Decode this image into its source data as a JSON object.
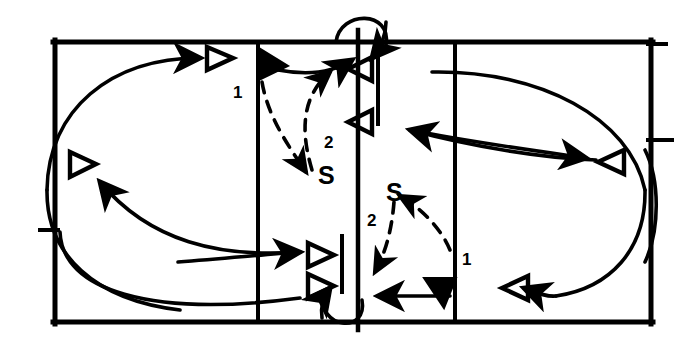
{
  "diagram": {
    "type": "sports-play-diagram",
    "surface_color": "#ffffff",
    "ink_color": "#000000",
    "court": {
      "left_sideline_x": 53,
      "right_sideline_x": 653,
      "top_endline_y": 42,
      "bottom_endline_y": 322,
      "net_x": 358,
      "left_attack_line_x": 258,
      "right_attack_line_x": 455,
      "tick_left_y": 230,
      "tick_right_y": 140
    },
    "labels": [
      {
        "id": "left-number-1",
        "text": "1",
        "x": 237,
        "y": 88,
        "size": "num"
      },
      {
        "id": "left-number-2",
        "text": "2",
        "x": 326,
        "y": 138,
        "size": "num"
      },
      {
        "id": "left-setter",
        "text": "S",
        "x": 320,
        "y": 167,
        "size": "setter"
      },
      {
        "id": "right-setter",
        "text": "S",
        "x": 388,
        "y": 183,
        "size": "setter"
      },
      {
        "id": "right-number-2",
        "text": "2",
        "x": 369,
        "y": 215,
        "size": "num"
      },
      {
        "id": "right-number-1",
        "text": "1",
        "x": 466,
        "y": 255,
        "size": "num"
      }
    ],
    "players": [
      {
        "id": "player-left-front-row",
        "shape": "triangle-hollow",
        "facing": "right",
        "x": 205,
        "y": 45
      },
      {
        "id": "player-left-back-row",
        "shape": "triangle-hollow",
        "facing": "right",
        "x": 68,
        "y": 150
      },
      {
        "id": "player-left-net-upper",
        "shape": "triangle-hollow",
        "facing": "right",
        "x": 306,
        "y": 243
      },
      {
        "id": "player-left-net-lower",
        "shape": "triangle-hollow",
        "facing": "right",
        "x": 306,
        "y": 275
      },
      {
        "id": "player-right-net-upper",
        "shape": "triangle-hollow",
        "facing": "left",
        "x": 369,
        "y": 55
      },
      {
        "id": "player-right-net-lower",
        "shape": "triangle-hollow",
        "facing": "left",
        "x": 369,
        "y": 108
      },
      {
        "id": "player-right-middle",
        "shape": "triangle-hollow",
        "facing": "left",
        "x": 595,
        "y": 148
      },
      {
        "id": "player-right-back",
        "shape": "triangle-hollow",
        "facing": "left",
        "x": 500,
        "y": 285
      },
      {
        "id": "attacker-left-net",
        "shape": "triangle-solid",
        "facing": "right",
        "x": 260,
        "y": 50
      },
      {
        "id": "attacker-right-net",
        "shape": "triangle-solid",
        "facing": "down",
        "x": 440,
        "y": 288
      }
    ],
    "movement_paths": [
      {
        "id": "path-left-sweep-top",
        "style": "solid",
        "note": "long curving run from left back corner up to left front"
      },
      {
        "id": "path-left-sweep-bottom",
        "style": "solid",
        "note": "long curving run from left front down to left back"
      },
      {
        "id": "path-left-setter-out",
        "style": "dashed",
        "label": "1",
        "note": "setter release from net down into zone 2"
      },
      {
        "id": "path-left-setter-in",
        "style": "dashed",
        "label": "2",
        "note": "setter penetration back up to net"
      },
      {
        "id": "path-right-setter-out",
        "style": "dashed",
        "label": "1",
        "note": "setter release from net toward zone 2"
      },
      {
        "id": "path-right-setter-in",
        "style": "dashed",
        "label": "2",
        "note": "setter penetration back up to the net"
      },
      {
        "id": "path-right-sweep-top",
        "style": "solid",
        "note": "curving run on right side toward the net"
      },
      {
        "id": "path-right-sweep-bottom",
        "style": "solid",
        "note": "curving run on right side back toward the endline"
      },
      {
        "id": "path-right-cross",
        "style": "solid",
        "note": "double-headed diagonal exchange on the right side"
      },
      {
        "id": "path-net-loop-top",
        "style": "solid",
        "note": "loop over the top of the net at the antenna"
      },
      {
        "id": "path-net-loop-bottom",
        "style": "solid",
        "note": "loop under the net at the bottom antenna"
      }
    ]
  }
}
